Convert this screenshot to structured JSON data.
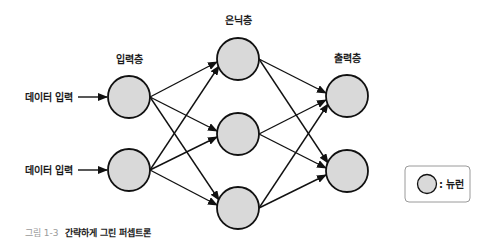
{
  "diagram": {
    "title": "간략하게 그린 퍼셉트론",
    "layers": [
      {
        "name": "input",
        "label": "입력층",
        "label_pos": [
          129,
          63
        ],
        "neurons": [
          [
            129,
            97
          ],
          [
            129,
            170
          ]
        ]
      },
      {
        "name": "hidden",
        "label": "은닉층",
        "label_pos": [
          238,
          24
        ],
        "neurons": [
          [
            238,
            59
          ],
          [
            238,
            134
          ],
          [
            238,
            208
          ]
        ]
      },
      {
        "name": "output",
        "label": "출력층",
        "label_pos": [
          347,
          62
        ],
        "neurons": [
          [
            347,
            96
          ],
          [
            347,
            171
          ]
        ]
      }
    ],
    "neuron_radius": 21,
    "connections": "fully-connected between adjacent layers",
    "inputs": [
      {
        "label": "데이터 입력",
        "y": 97
      },
      {
        "label": "데이터 입력",
        "y": 170
      }
    ],
    "colors": {
      "neuron_fill": "#d9d9d9",
      "stroke": "#111111",
      "legend_border": "#9a9a9a",
      "caption_number": "#9a9a9a"
    }
  },
  "labels": {
    "input_layer": "입력층",
    "hidden_layer": "은닉층",
    "output_layer": "출력층",
    "data_input_1": "데이터 입력",
    "data_input_2": "데이터 입력"
  },
  "legend": {
    "symbol": "neuron-circle",
    "text": ": 뉴런"
  },
  "caption": {
    "number": "그림 1-3",
    "title": "간략하게 그린 퍼셉트론"
  }
}
